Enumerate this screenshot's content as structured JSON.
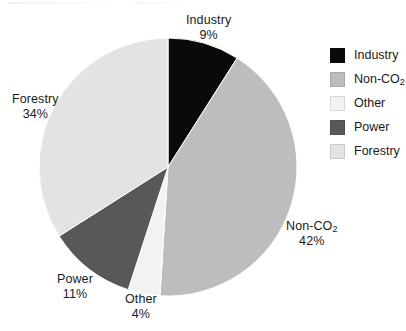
{
  "chart_data": {
    "type": "pie",
    "title": "",
    "categories": [
      "Industry",
      "Non-CO2",
      "Other",
      "Power",
      "Forestry"
    ],
    "values": [
      9,
      42,
      4,
      11,
      34
    ],
    "value_unit": "%",
    "start_angle_deg": 0,
    "direction": "clockwise",
    "legend_position": "right",
    "grid": false,
    "colors": [
      "#0a0a0a",
      "#bdbdbd",
      "#f2f2f2",
      "#585858",
      "#e3e3e3"
    ],
    "slices": [
      {
        "label": "Industry",
        "value": 9,
        "display_value": "9%",
        "color": "#0a0a0a",
        "label_line1": "Industry",
        "label_line2": "9%"
      },
      {
        "label": "Non-CO2",
        "value": 42,
        "display_value": "42%",
        "color": "#bdbdbd",
        "label_line1": "Non-CO",
        "label_sub": "2",
        "label_line2": "42%"
      },
      {
        "label": "Other",
        "value": 4,
        "display_value": "4%",
        "color": "#f2f2f2",
        "label_line1": "Other",
        "label_line2": "4%"
      },
      {
        "label": "Power",
        "value": 11,
        "display_value": "11%",
        "color": "#585858",
        "label_line1": "Power",
        "label_line2": "11%"
      },
      {
        "label": "Forestry",
        "value": 34,
        "display_value": "34%",
        "color": "#e3e3e3",
        "label_line1": "Forestry",
        "label_line2": "34%"
      }
    ]
  },
  "legend": {
    "items": [
      {
        "label": "Industry",
        "color": "#0a0a0a"
      },
      {
        "label": "Non-CO",
        "sub": "2",
        "color": "#bdbdbd"
      },
      {
        "label": "Other",
        "color": "#f2f2f2"
      },
      {
        "label": "Power",
        "color": "#585858"
      },
      {
        "label": "Forestry",
        "color": "#e3e3e3"
      }
    ]
  }
}
